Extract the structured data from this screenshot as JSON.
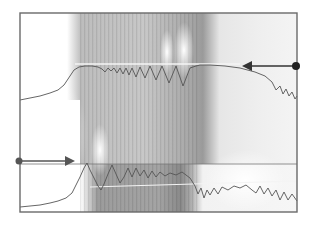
{
  "figure": {
    "width": 313,
    "height": 227,
    "background": "#ffffff",
    "frame": {
      "x": 20,
      "y": 13,
      "width": 277,
      "height": 199,
      "stroke": "#6a6a6a"
    },
    "divider_y": 164,
    "colors": {
      "trace": "#555555",
      "arrow": "#333333",
      "white_line": "#f4f4f4",
      "field_light": "#d8d8d8",
      "field_mid": "#b4b4b4",
      "field_dark": "#8e8e8e"
    },
    "upper_trace": {
      "points": "20,100 30,98 40,96 50,93 58,90 64,85 70,76 74,70 79,67 85,66 92,66 98,67 102,69 105,72 108,68 111,71 114,68 117,73 120,68 123,74 126,68 129,75 132,68 136,77 140,67 145,78 150,66 156,80 162,66 169,83 176,66 183,86 190,68 196,66 200,65 210,65 225,66 240,68 255,72 265,76 272,82 276,90 280,86 283,94 286,89 289,96 292,92 295,99 297,96"
    },
    "lower_trace": {
      "points": "20,207 30,206 40,205 50,203 58,201 66,198 72,193 76,185 80,177 84,168 87,163 90,170 94,178 98,186 101,190 104,184 108,174 112,165 116,174 120,183 124,177 128,168 132,177 136,168 140,176 144,170 148,178 152,171 156,177 160,172 165,176 170,173 176,175 182,172 190,178 195,186 198,194 201,188 204,198 207,190 210,195 214,188 218,194 222,187 228,190 234,186 240,188 246,185 252,190 256,193 260,186 264,194 268,188 272,196 276,190 280,200 284,192 288,200 292,194 297,201"
    },
    "upper_white_line": {
      "x1": 75,
      "y1": 64,
      "x2": 240,
      "y2": 64
    },
    "lower_white_line": {
      "x1": 90,
      "y1": 187,
      "x2": 297,
      "y2": 181
    },
    "arrows": [
      {
        "name": "upper-arrow",
        "dot": {
          "x": 296,
          "y": 66
        },
        "tip": {
          "x": 242,
          "y": 66
        },
        "direction": "left"
      },
      {
        "name": "lower-arrow",
        "dot": {
          "x": 19,
          "y": 161
        },
        "tip": {
          "x": 75,
          "y": 161
        },
        "direction": "right"
      }
    ]
  }
}
